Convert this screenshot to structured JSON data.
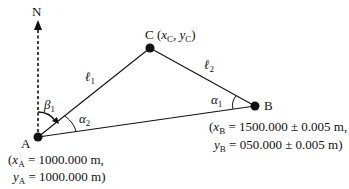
{
  "diagram": {
    "north_label": "N",
    "points": {
      "A": {
        "label": "A",
        "coord_line1_pre": "(",
        "coord_line1_var": "x",
        "coord_line1_sub": "A",
        "coord_line1_val": " = 1000.000 m,",
        "coord_line2_var": "y",
        "coord_line2_sub": "A",
        "coord_line2_val": " = 1000.000 m)"
      },
      "B": {
        "label": "B",
        "coord_line1_pre": "(",
        "coord_line1_var": "x",
        "coord_line1_sub": "B",
        "coord_line1_val": " = 1500.000 ± 0.005 m,",
        "coord_line2_var": "y",
        "coord_line2_sub": "B",
        "coord_line2_val": " = 050.000 ± 0.005 m)"
      },
      "C": {
        "label": "C",
        "coord_pre": " (",
        "x_var": "x",
        "x_sub": "C",
        "sep": ", ",
        "y_var": "y",
        "y_sub": "C",
        "post": ")"
      }
    },
    "sides": {
      "l1": {
        "symbol": "ℓ",
        "sub": "1"
      },
      "l2": {
        "symbol": "ℓ",
        "sub": "2"
      }
    },
    "angles": {
      "beta1": {
        "symbol": "β",
        "sub": "1"
      },
      "alpha1": {
        "symbol": "α",
        "sub": "1"
      },
      "alpha2": {
        "symbol": "α",
        "sub": "2"
      }
    }
  }
}
